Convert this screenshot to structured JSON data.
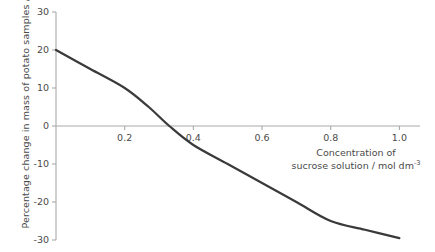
{
  "chart_data": {
    "type": "line",
    "title": "",
    "subtitle": "",
    "xlabel_line1": "Concentration of",
    "xlabel_line2_pre": "sucrose solution / mol dm",
    "xlabel_line2_sup": "-3",
    "ylabel": "Percentage change in mass of potato samples / %",
    "xlim": [
      0,
      1.06
    ],
    "ylim": [
      -30,
      30
    ],
    "xticks": [
      0.2,
      0.4,
      0.6,
      0.8,
      1.0
    ],
    "xtick_labels": [
      "0.2",
      "0.4",
      "0.6",
      "0.8",
      "1.0"
    ],
    "yticks": [
      30,
      20,
      10,
      0,
      -10,
      -20,
      -30
    ],
    "ytick_labels": [
      "30",
      "20",
      "10",
      "0",
      "-10",
      "-20",
      "-30"
    ],
    "grid": false,
    "legend": "none",
    "x": [
      0.0,
      0.1,
      0.2,
      0.27,
      0.33,
      0.4,
      0.5,
      0.6,
      0.7,
      0.8,
      0.9,
      1.0
    ],
    "y": [
      20.0,
      15.0,
      10.0,
      5.0,
      0.0,
      -5.0,
      -10.0,
      -15.0,
      -20.0,
      -25.0,
      -27.3,
      -29.5
    ],
    "series": [
      {
        "name": "Percentage change in mass",
        "points": [
          {
            "x": 0.0,
            "y": 20.0
          },
          {
            "x": 0.1,
            "y": 15.0
          },
          {
            "x": 0.2,
            "y": 10.0
          },
          {
            "x": 0.27,
            "y": 5.0
          },
          {
            "x": 0.33,
            "y": 0.0
          },
          {
            "x": 0.4,
            "y": -5.0
          },
          {
            "x": 0.5,
            "y": -10.0
          },
          {
            "x": 0.6,
            "y": -15.0
          },
          {
            "x": 0.7,
            "y": -20.0
          },
          {
            "x": 0.8,
            "y": -25.0
          },
          {
            "x": 0.9,
            "y": -27.3
          },
          {
            "x": 1.0,
            "y": -29.5
          }
        ],
        "color": "#3a3a3a"
      }
    ],
    "zero_crossing_x": 0.33,
    "colors": {
      "curve": "#3a3a3a",
      "axis": "#a9a9a9",
      "text": "#4a4a4a",
      "background": "#ffffff"
    }
  }
}
